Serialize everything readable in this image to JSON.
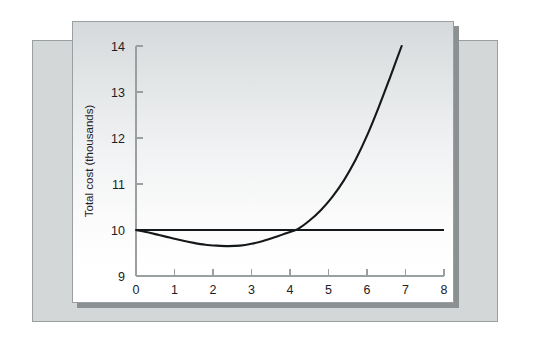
{
  "figure": {
    "background_color": "#ffffff",
    "panel_back_color": "#d3d7d8",
    "panel_main_color": "#d0d4d6",
    "plot_area_color": "#ffffff",
    "line_color": "#15181a",
    "axis_color": "#9a9fa1"
  },
  "chart_data": {
    "type": "line",
    "title": "",
    "xlabel": "Age to replace in years",
    "ylabel": "Total cost (thousands)",
    "xlim": [
      0,
      8
    ],
    "ylim": [
      9,
      14
    ],
    "xticks": [
      0,
      1,
      2,
      3,
      4,
      5,
      6,
      7,
      8
    ],
    "xtick_labels": [
      "0",
      "1",
      "2",
      "3",
      "4",
      "5",
      "6",
      "7",
      "8"
    ],
    "yticks": [
      9,
      10,
      11,
      12,
      13,
      14
    ],
    "ytick_labels": [
      "9",
      "10",
      "11",
      "12",
      "13",
      "14"
    ],
    "grid": false,
    "legend": null,
    "series": [
      {
        "name": "Total cost curve",
        "style": "solid",
        "color": "#15181a",
        "x": [
          0.0,
          0.3,
          0.6,
          0.9,
          1.2,
          1.5,
          1.8,
          2.1,
          2.4,
          2.7,
          3.0,
          3.3,
          3.6,
          3.9,
          4.2,
          4.5,
          4.8,
          5.1,
          5.4,
          5.7,
          6.0,
          6.3,
          6.6,
          6.9
        ],
        "y": [
          10.0,
          9.95,
          9.89,
          9.83,
          9.77,
          9.72,
          9.68,
          9.66,
          9.65,
          9.66,
          9.7,
          9.76,
          9.84,
          9.93,
          10.02,
          10.2,
          10.43,
          10.72,
          11.08,
          11.52,
          12.05,
          12.66,
          13.32,
          14.0
        ]
      },
      {
        "name": "Constant cost line",
        "style": "solid",
        "color": "#15181a",
        "x": [
          0,
          8
        ],
        "y": [
          10.0,
          10.0
        ]
      }
    ],
    "annotations": [
      {
        "text": "minimum of total cost curve",
        "x": 2.4,
        "y": 9.65
      },
      {
        "text": "curves intersect",
        "x": 4.2,
        "y": 10.0
      }
    ]
  }
}
